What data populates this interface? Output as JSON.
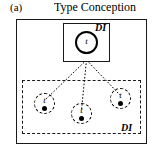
{
  "figure": {
    "panel_label": "(a)",
    "title": "Type Conception",
    "labels": {
      "di_top": "DI",
      "di_bottom": "DI"
    },
    "nodes": {
      "root": {
        "glyph": "t"
      },
      "leaves": [
        {
          "glyph": "t"
        },
        {
          "glyph": "t"
        },
        {
          "glyph": "t"
        }
      ]
    },
    "colors": {
      "stroke": "#1a1a1a",
      "fill": "#ffffff",
      "text": "#000000"
    }
  }
}
